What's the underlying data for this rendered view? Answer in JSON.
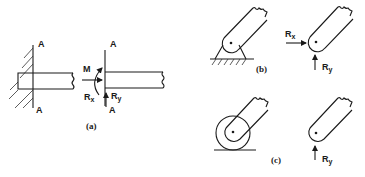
{
  "figure": {
    "panels": [
      {
        "id": "a",
        "caption": "(a)",
        "description": "Fixed (built-in) support and its free-body reactions",
        "labels": {
          "section_top_left": "A",
          "section_bottom_left": "A",
          "section_top_right": "A",
          "section_bottom_right": "A",
          "moment": "M",
          "rx": "R",
          "rx_sub": "x",
          "ry": "R",
          "ry_sub": "y"
        }
      },
      {
        "id": "b",
        "caption": "(b)",
        "description": "Pin support and its free-body reactions",
        "labels": {
          "rx": "R",
          "rx_sub": "x",
          "ry": "R",
          "ry_sub": "y"
        }
      },
      {
        "id": "c",
        "caption": "(c)",
        "description": "Roller support and its free-body reaction",
        "labels": {
          "ry": "R",
          "ry_sub": "y"
        }
      }
    ],
    "colors": {
      "ink": "#1a1a1a",
      "background": "#ffffff"
    }
  }
}
